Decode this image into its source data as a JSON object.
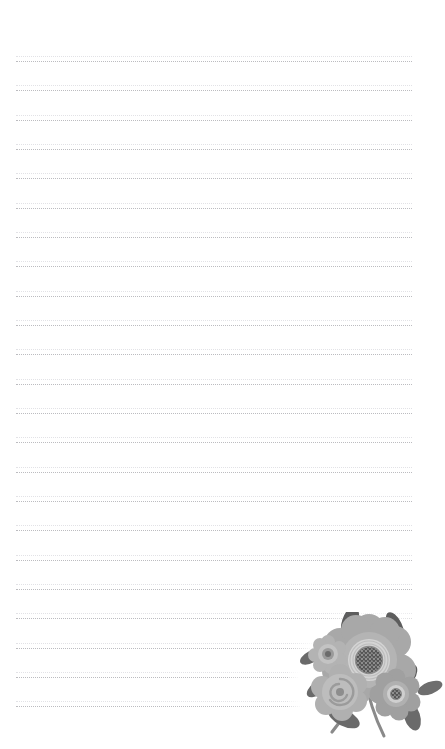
{
  "page": {
    "kind": "stationery-sheet",
    "width_px": 445,
    "height_px": 749,
    "background_color": "#ffffff",
    "content_text": ""
  },
  "ruling": {
    "name": "dotted-rule-lines",
    "style": "dotted",
    "line_color": "#b9b9bd",
    "faint_line_color": "#dcdce0",
    "line_count": 23,
    "first_line_y": 61,
    "line_spacing_px": 29.3,
    "left_x": 16,
    "right_x": 412,
    "line_width_px": 396,
    "lines_y": [
      61,
      90,
      120,
      149,
      178,
      208,
      237,
      266,
      296,
      325,
      354,
      384,
      413,
      442,
      472,
      501,
      530,
      560,
      589,
      618,
      648,
      677,
      706
    ]
  },
  "illustration": {
    "name": "floral-corner-illustration",
    "description": "grayscale flower bouquet in bottom-right corner",
    "position": {
      "left": 288,
      "top": 612,
      "width": 157,
      "height": 137
    },
    "colors": {
      "petal_light": "#c6c6c6",
      "petal_mid": "#a3a3a3",
      "petal_dark": "#8e8e8e",
      "center_ring": "#d8d8d8",
      "center_dark": "#5c5c5c",
      "leaf": "#6e6e6e",
      "leaf_dark": "#595959",
      "stem": "#8a8a8a"
    },
    "elements": [
      {
        "name": "large-bloom",
        "type": "flower",
        "petals": 9
      },
      {
        "name": "small-bloom-left",
        "type": "flower",
        "petals": 8
      },
      {
        "name": "spiral-rose",
        "type": "rose"
      },
      {
        "name": "small-bloom-right",
        "type": "flower",
        "petals": 8
      },
      {
        "name": "leaf-cluster",
        "type": "leaves",
        "count": 9
      },
      {
        "name": "stems",
        "type": "stems",
        "count": 3
      }
    ]
  }
}
